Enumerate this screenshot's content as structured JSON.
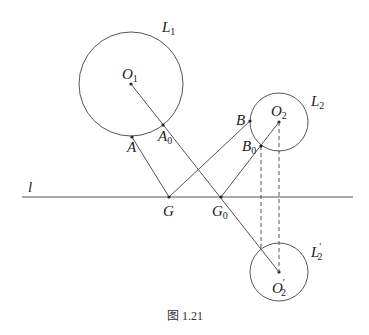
{
  "figure": {
    "caption": "图 1.21",
    "line_label": "l",
    "circles": [
      {
        "id": "L1",
        "label": "L",
        "sub": "1",
        "prime": "",
        "center_label": "O",
        "center_sub": "1",
        "center_prime": ""
      },
      {
        "id": "L2",
        "label": "L",
        "sub": "2",
        "prime": "",
        "center_label": "O",
        "center_sub": "2",
        "center_prime": ""
      },
      {
        "id": "L2p",
        "label": "L",
        "sub": "2",
        "prime": "′",
        "center_label": "O",
        "center_sub": "2",
        "center_prime": "′"
      }
    ],
    "points": {
      "A": {
        "label": "A",
        "sub": ""
      },
      "A0": {
        "label": "A",
        "sub": "0"
      },
      "B": {
        "label": "B",
        "sub": ""
      },
      "B0": {
        "label": "B",
        "sub": "0"
      },
      "G": {
        "label": "G",
        "sub": ""
      },
      "G0": {
        "label": "G",
        "sub": "0"
      }
    }
  }
}
